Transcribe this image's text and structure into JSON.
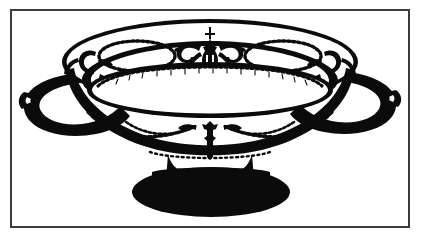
{
  "figure": {
    "technique": "black and white line engraving",
    "caption": ""
  },
  "frame": {
    "border_color": "#3c3c3c",
    "border_width_px": 2,
    "background_color": "#ffffff",
    "left_px": 10,
    "top_px": 9,
    "width_px": 400,
    "height_px": 219
  },
  "palette": {
    "ink": "#0b0b0b",
    "paper": "#ffffff",
    "frame": "#3c3c3c"
  },
  "parts": [
    {
      "id": "rim-band",
      "label": "decorated rim band"
    },
    {
      "id": "oval-medallion-left",
      "label": "left beaded oval medallion"
    },
    {
      "id": "oval-medallion-right",
      "label": "right beaded oval medallion"
    },
    {
      "id": "center-urn-motif",
      "label": "central urn and scroll motif"
    },
    {
      "id": "inner-bowl",
      "label": "inner bowl well with beaded arc"
    },
    {
      "id": "handle-left",
      "label": "left ring handle"
    },
    {
      "id": "handle-right",
      "label": "right ring handle"
    },
    {
      "id": "body-swags",
      "label": "garland swags on lower body"
    },
    {
      "id": "pedestal-foot",
      "label": "solid black pedestal foot"
    }
  ]
}
